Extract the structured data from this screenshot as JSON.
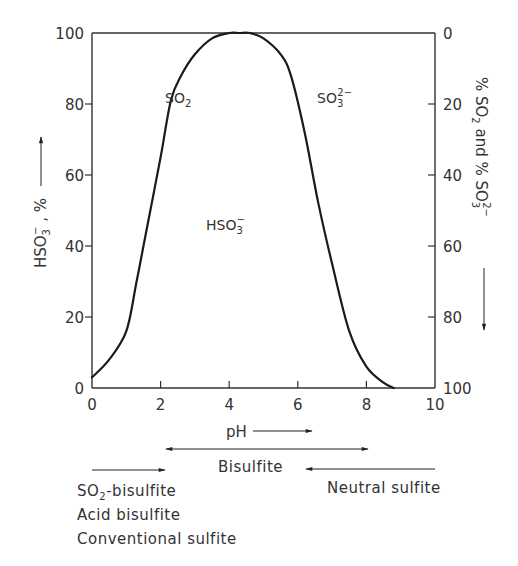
{
  "chart_data": {
    "type": "line",
    "title": "",
    "xlabel": "pH",
    "ylabel_left": "HSO3-, %",
    "ylabel_right": "% SO2 and % SO3 2-",
    "xlim": [
      0,
      10
    ],
    "ylim": [
      0,
      100
    ],
    "x_ticks": [
      "0",
      "2",
      "4",
      "6",
      "8",
      "10"
    ],
    "y_ticks_left": [
      "0",
      "20",
      "40",
      "60",
      "80",
      "100"
    ],
    "y_ticks_right": [
      "100",
      "80",
      "60",
      "40",
      "20",
      "0"
    ],
    "grid": false,
    "series": [
      {
        "name": "HSO3-",
        "x": [
          0,
          0.5,
          1.0,
          1.3,
          1.6,
          2.0,
          2.3,
          2.6,
          3.0,
          3.5,
          4.0,
          4.3,
          4.6,
          5.0,
          5.5,
          5.8,
          6.2,
          6.6,
          7.0,
          7.5,
          8.0,
          8.5,
          8.8
        ],
        "values": [
          3,
          8,
          16,
          30,
          45,
          65,
          81,
          88,
          94,
          98.5,
          100,
          100,
          100,
          98.5,
          94,
          88,
          72,
          52,
          35,
          16,
          6,
          1.5,
          0
        ]
      }
    ],
    "annotations": [
      {
        "text": "SO2",
        "x": 2.1,
        "y": 84
      },
      {
        "text": "SO3 2-",
        "x": 6.4,
        "y": 84
      },
      {
        "text": "HSO3-",
        "x": 3.3,
        "y": 46
      }
    ],
    "process_ranges": [
      {
        "name": "SO2-bisulfite",
        "ph_from": 0,
        "ph_to": 2
      },
      {
        "name": "Acid bisulfite",
        "ph_from": 0,
        "ph_to": 2
      },
      {
        "name": "Conventional sulfite",
        "ph_from": 0,
        "ph_to": 2
      },
      {
        "name": "Bisulfite",
        "ph_from": 2,
        "ph_to": 8
      },
      {
        "name": "Neutral sulfite",
        "ph_from": 10,
        "ph_to": 6.2
      }
    ]
  },
  "labels": {
    "y_left_main": "HSO",
    "y_left_sub": "3",
    "y_left_sup": "−",
    "y_left_tail": " , %",
    "y_right_pre": "% SO",
    "y_right_sub": "2",
    "y_right_mid": " and % SO",
    "y_right_sub2": "3",
    "y_right_sup2": "2−",
    "x_axis": "pH",
    "ann_so2_main": "SO",
    "ann_so2_sub": "2",
    "ann_so3_main": "SO",
    "ann_so3_sub": "3",
    "ann_so3_sup": "2−",
    "ann_hso3_main": "HSO",
    "ann_hso3_sub": "3",
    "ann_hso3_sup": "−",
    "bisulfite": "Bisulfite",
    "neutral_sulfite": "Neutral sulfite",
    "so2_bisulfite_main": "SO",
    "so2_bisulfite_sub": "2",
    "so2_bisulfite_tail": "-bisulfite",
    "acid_bisulfite": "Acid bisulfite",
    "conventional_sulfite": "Conventional sulfite"
  },
  "colors": {
    "line": "#1a1a1a",
    "text": "#333333",
    "background": "#ffffff"
  }
}
